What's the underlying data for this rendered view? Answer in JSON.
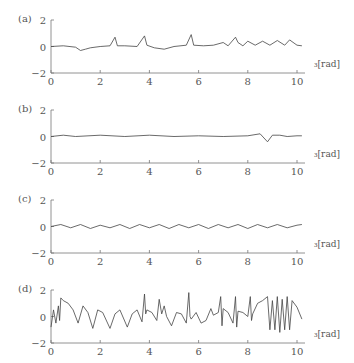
{
  "figure": {
    "xunit_label": "₃[rad]",
    "xticks": [
      "0",
      "2",
      "4",
      "6",
      "8",
      "10"
    ],
    "yticks": [
      "2",
      "0",
      "−2"
    ]
  },
  "panels": [
    {
      "label": "(a)",
      "ytick_bottom": "−2"
    },
    {
      "label": "(b)",
      "ytick_bottom": "−2"
    },
    {
      "label": "(c)",
      "ytick_bottom": "−2"
    },
    {
      "label": "(d)",
      "ytick_bottom": "−2"
    }
  ],
  "chart_data": [
    {
      "type": "line",
      "title": "(a)",
      "xlabel": "₃[rad]",
      "ylabel": "",
      "xlim": [
        0,
        10.4
      ],
      "ylim": [
        -2,
        2
      ],
      "grid": false,
      "xticks": [
        0,
        2,
        4,
        6,
        8,
        10
      ],
      "yticks": [
        -2,
        0,
        2
      ],
      "x": [
        0,
        0.5,
        1.0,
        1.2,
        1.4,
        1.6,
        2.0,
        2.4,
        2.6,
        2.7,
        3.0,
        3.5,
        3.8,
        3.9,
        4.2,
        4.6,
        5.0,
        5.5,
        5.7,
        5.8,
        6.2,
        6.6,
        7.0,
        7.2,
        7.5,
        7.6,
        7.8,
        8.0,
        8.3,
        8.6,
        8.9,
        9.2,
        9.5,
        9.7,
        10.0,
        10.2
      ],
      "y": [
        0,
        0.05,
        -0.05,
        -0.3,
        -0.2,
        -0.1,
        0,
        0.05,
        0.7,
        0.05,
        0.05,
        0,
        0.8,
        0.1,
        -0.1,
        -0.2,
        0,
        0.1,
        0.9,
        0.1,
        0.05,
        0.1,
        0.3,
        0.05,
        0.7,
        0.3,
        0.05,
        0.4,
        0.1,
        0.4,
        0.1,
        0.45,
        0.1,
        0.5,
        0.1,
        0.05
      ]
    },
    {
      "type": "line",
      "title": "(b)",
      "xlabel": "₃[rad]",
      "ylabel": "",
      "xlim": [
        0,
        10.4
      ],
      "ylim": [
        -2,
        2
      ],
      "grid": false,
      "xticks": [
        0,
        2,
        4,
        6,
        8,
        10
      ],
      "yticks": [
        -2,
        0,
        2
      ],
      "x": [
        0,
        0.5,
        1,
        2,
        3,
        4,
        5,
        6,
        7,
        8,
        8.5,
        8.8,
        9.0,
        9.3,
        9.6,
        10,
        10.2
      ],
      "y": [
        0,
        0.1,
        0,
        0.1,
        0,
        0.1,
        0,
        0.05,
        0,
        0.05,
        0.2,
        -0.4,
        0.1,
        0.1,
        0,
        0.05,
        0.05
      ]
    },
    {
      "type": "line",
      "title": "(c)",
      "xlabel": "₃[rad]",
      "ylabel": "",
      "xlim": [
        0,
        10.4
      ],
      "ylim": [
        -2,
        2
      ],
      "grid": false,
      "xticks": [
        0,
        2,
        4,
        6,
        8,
        10
      ],
      "yticks": [
        -2,
        0,
        2
      ],
      "x": [
        0,
        0.4,
        0.8,
        1.2,
        1.6,
        2.0,
        2.4,
        2.8,
        3.2,
        3.6,
        4.0,
        4.4,
        4.8,
        5.2,
        5.6,
        6.0,
        6.4,
        6.8,
        7.2,
        7.6,
        8.0,
        8.4,
        8.8,
        9.2,
        9.6,
        10.0,
        10.2
      ],
      "y": [
        0,
        0.15,
        -0.1,
        0.15,
        -0.15,
        0.1,
        -0.1,
        0.15,
        -0.15,
        0.15,
        -0.1,
        0.15,
        -0.15,
        0.15,
        -0.1,
        0.15,
        -0.15,
        0.15,
        -0.1,
        0.15,
        -0.15,
        0.15,
        -0.1,
        0.15,
        -0.1,
        0.1,
        0.15
      ]
    },
    {
      "type": "line",
      "title": "(d)",
      "xlabel": "₃[rad]",
      "ylabel": "",
      "xlim": [
        0,
        10.4
      ],
      "ylim": [
        -2,
        2
      ],
      "grid": false,
      "xticks": [
        0,
        2,
        4,
        6,
        8,
        10
      ],
      "yticks": [
        -2,
        0,
        2
      ],
      "x": [
        0,
        0.1,
        0.2,
        0.3,
        0.35,
        0.4,
        0.5,
        0.7,
        0.9,
        1.1,
        1.3,
        1.5,
        1.7,
        1.9,
        2.1,
        2.4,
        2.6,
        2.8,
        3.1,
        3.3,
        3.5,
        3.7,
        3.8,
        3.85,
        3.9,
        4.1,
        4.3,
        4.4,
        4.5,
        4.6,
        4.7,
        4.9,
        5.1,
        5.3,
        5.5,
        5.6,
        5.65,
        5.7,
        5.9,
        6.1,
        6.3,
        6.5,
        6.6,
        6.8,
        6.9,
        6.95,
        7.0,
        7.2,
        7.4,
        7.5,
        7.55,
        7.6,
        7.8,
        8.0,
        8.1,
        8.15,
        8.2,
        8.4,
        8.6,
        8.8,
        8.9,
        9.0,
        9.1,
        9.2,
        9.3,
        9.4,
        9.5,
        9.6,
        9.7,
        9.8,
        10.0,
        10.2
      ],
      "y": [
        -0.8,
        0.5,
        -0.5,
        0.8,
        -0.3,
        1.4,
        1.2,
        1.0,
        0.5,
        -0.5,
        0.8,
        0.3,
        -0.9,
        0.5,
        0.3,
        -0.9,
        0.2,
        0.5,
        -0.8,
        0.2,
        0.5,
        -0.4,
        1.7,
        0.2,
        0.5,
        0.3,
        -0.3,
        1.3,
        0.2,
        0.8,
        0.0,
        -0.7,
        0.3,
        0.2,
        -0.5,
        1.8,
        0.0,
        -0.2,
        0.3,
        -0.5,
        -0.3,
        0.6,
        0.1,
        0.3,
        1.5,
        -0.7,
        0.6,
        0.3,
        -0.5,
        1.5,
        -0.8,
        0.4,
        0.3,
        0.0,
        1.5,
        -0.3,
        0.2,
        1.0,
        1.2,
        1.5,
        -1.0,
        1.2,
        -1.0,
        1.5,
        -1.2,
        1.3,
        -1.0,
        1.5,
        -1.0,
        1.2,
        0.7,
        -0.2
      ]
    }
  ]
}
